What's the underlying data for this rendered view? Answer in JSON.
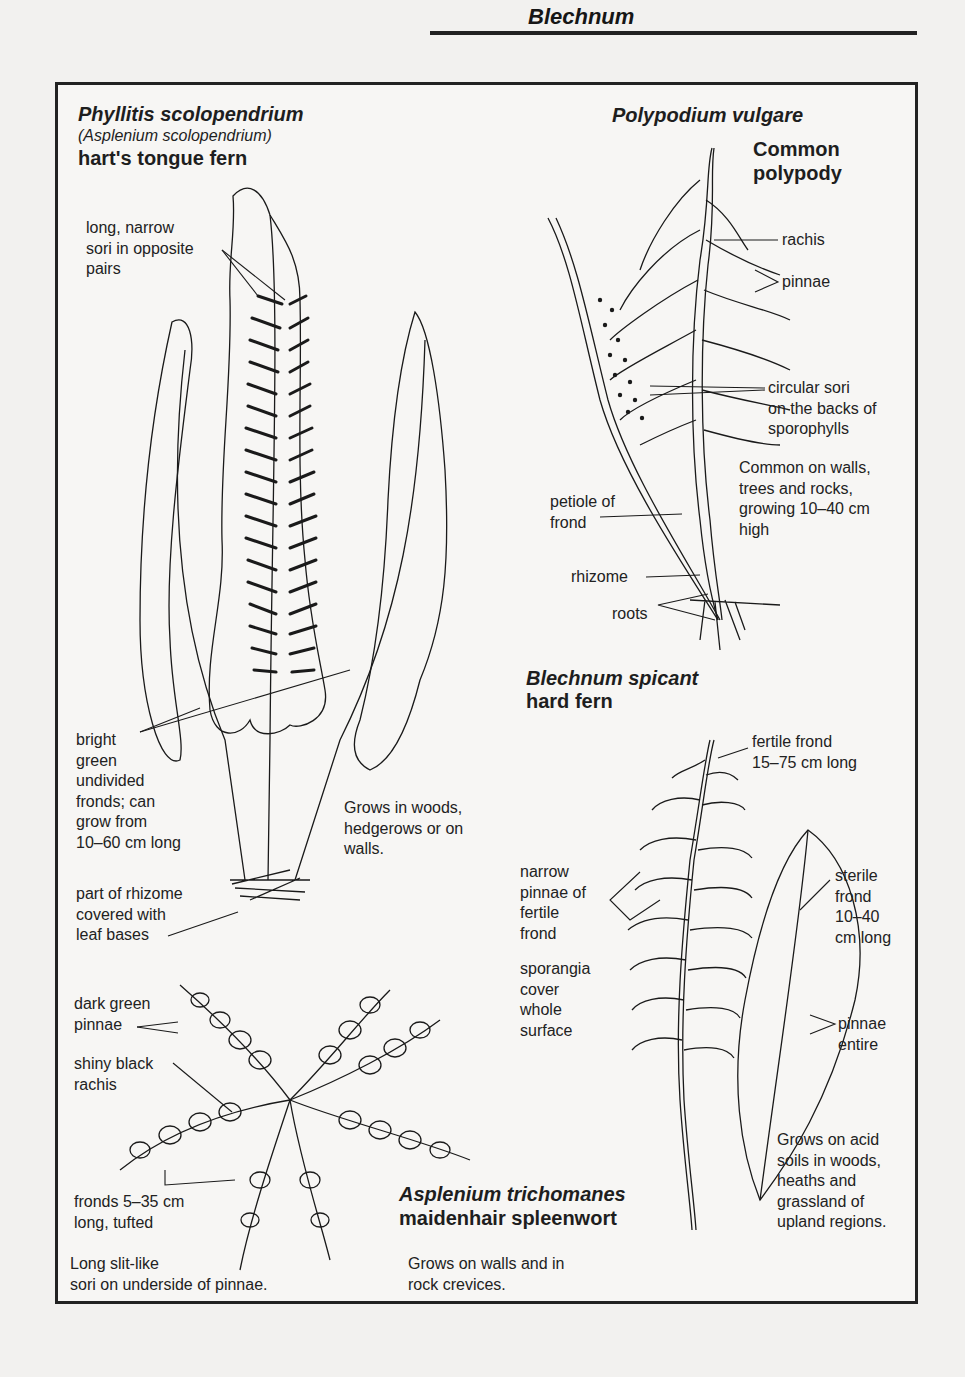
{
  "page": {
    "header_title": "Blechnum"
  },
  "sections": {
    "harts_tongue": {
      "scientific_name": "Phyllitis scolopendrium",
      "synonym": "(Asplenium scolopendrium)",
      "common_name": "hart's tongue fern",
      "labels": {
        "sori": [
          "long, narrow",
          "sori in opposite",
          "pairs"
        ],
        "fronds": [
          "bright",
          "green",
          "undivided",
          "fronds; can",
          "grow from",
          "10–60 cm long"
        ],
        "rhizome": [
          "part of rhizome",
          "covered with",
          "leaf bases"
        ]
      },
      "habitat": [
        "Grows in woods,",
        "hedgerows or on",
        "walls."
      ]
    },
    "polypody": {
      "scientific_name": "Polypodium vulgare",
      "common_name": [
        "Common",
        "polypody"
      ],
      "labels": {
        "rachis": "rachis",
        "pinnae": "pinnae",
        "sori": [
          "circular sori",
          "on the backs of",
          "sporophylls"
        ],
        "petiole": [
          "petiole of",
          "frond"
        ],
        "rhizome": "rhizome",
        "roots": "roots"
      },
      "habitat": [
        "Common on walls,",
        "trees and rocks,",
        "growing 10–40 cm",
        "high"
      ]
    },
    "hard_fern": {
      "scientific_name": "Blechnum spicant",
      "common_name": "hard fern",
      "labels": {
        "fertile_frond": [
          "fertile frond",
          "15–75 cm long"
        ],
        "narrow_pinnae": [
          "narrow",
          "pinnae of",
          "fertile",
          "frond"
        ],
        "sporangia": [
          "sporangia",
          "cover",
          "whole",
          "surface"
        ],
        "sterile_frond": [
          "sterile",
          "frond",
          "10–40",
          "cm long"
        ],
        "pinnae_entire": [
          "pinnae",
          "entire"
        ]
      },
      "habitat": [
        "Grows on acid",
        "soils in woods,",
        "heaths and",
        "grassland of",
        "upland regions."
      ]
    },
    "maidenhair_spleenwort": {
      "scientific_name": "Asplenium trichomanes",
      "common_name": "maidenhair spleenwort",
      "labels": {
        "pinnae": [
          "dark green",
          "pinnae"
        ],
        "rachis": [
          "shiny black",
          "rachis"
        ],
        "fronds": [
          "fronds 5–35 cm",
          "long, tufted"
        ],
        "sori": [
          "Long slit-like",
          "sori on underside of pinnae."
        ]
      },
      "habitat": [
        "Grows on walls and in",
        "rock crevices."
      ]
    }
  }
}
